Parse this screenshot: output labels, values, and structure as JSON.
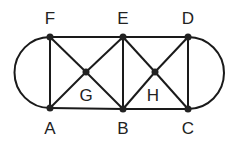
{
  "diagram": {
    "type": "graph",
    "nodes": [
      {
        "id": "F",
        "label": "F",
        "x": 50,
        "y": 37,
        "lx": 50,
        "ly": 24
      },
      {
        "id": "E",
        "label": "E",
        "x": 123,
        "y": 37,
        "lx": 123,
        "ly": 24
      },
      {
        "id": "D",
        "label": "D",
        "x": 188,
        "y": 37,
        "lx": 188,
        "ly": 24
      },
      {
        "id": "A",
        "label": "A",
        "x": 50,
        "y": 108,
        "lx": 50,
        "ly": 134
      },
      {
        "id": "B",
        "label": "B",
        "x": 123,
        "y": 109,
        "lx": 123,
        "ly": 134
      },
      {
        "id": "C",
        "label": "C",
        "x": 188,
        "y": 109,
        "lx": 188,
        "ly": 134
      },
      {
        "id": "G",
        "label": "G",
        "x": 86,
        "y": 72,
        "lx": 86,
        "ly": 101
      },
      {
        "id": "H",
        "label": "H",
        "x": 155,
        "y": 72,
        "lx": 153,
        "ly": 101
      }
    ],
    "edges": [
      [
        "F",
        "E"
      ],
      [
        "E",
        "D"
      ],
      [
        "A",
        "B"
      ],
      [
        "B",
        "C"
      ],
      [
        "F",
        "A"
      ],
      [
        "E",
        "B"
      ],
      [
        "D",
        "C"
      ],
      [
        "F",
        "G"
      ],
      [
        "G",
        "B"
      ],
      [
        "A",
        "G"
      ],
      [
        "G",
        "E"
      ],
      [
        "E",
        "H"
      ],
      [
        "H",
        "C"
      ],
      [
        "B",
        "H"
      ],
      [
        "H",
        "D"
      ]
    ],
    "arcs": [
      {
        "from": "F",
        "to": "A",
        "side": "left"
      },
      {
        "from": "D",
        "to": "C",
        "side": "right"
      }
    ],
    "colors": {
      "stroke": "#1a1a1a",
      "node": "#222222",
      "label": "#222222"
    }
  }
}
